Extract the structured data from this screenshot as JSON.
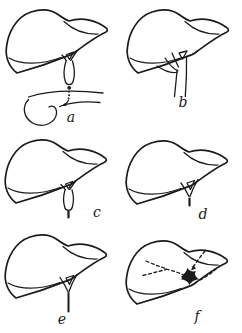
{
  "figure": {
    "kind": "anatomical-line-diagram",
    "line_color": "#1b1b1b",
    "background_color": "#ffffff",
    "panels": [
      {
        "id": "a",
        "label": "a"
      },
      {
        "id": "b",
        "label": "b"
      },
      {
        "id": "c",
        "label": "c"
      },
      {
        "id": "d",
        "label": "d"
      },
      {
        "id": "e",
        "label": "e"
      },
      {
        "id": "f",
        "label": "f"
      }
    ]
  }
}
